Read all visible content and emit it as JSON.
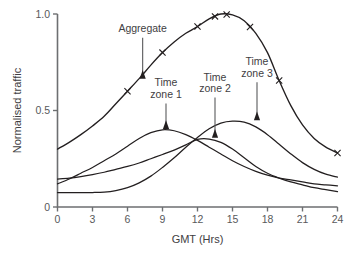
{
  "chart_data": {
    "type": "line",
    "title": "",
    "xlabel": "GMT (Hrs)",
    "ylabel": "Normalised traffic",
    "xlim": [
      0,
      24
    ],
    "ylim": [
      0,
      1.0
    ],
    "grid": false,
    "legend_position": "none",
    "xticks": [
      "0",
      "3",
      "6",
      "9",
      "12",
      "15",
      "18",
      "21",
      "24"
    ],
    "xtick_values": [
      0,
      3,
      6,
      9,
      12,
      15,
      18,
      21,
      24
    ],
    "yticks": [
      "0",
      "0.5",
      "1.0"
    ],
    "ytick_values": [
      0,
      0.5,
      1.0
    ],
    "x": [
      0,
      1,
      2,
      3,
      4,
      5,
      6,
      7,
      8,
      9,
      10,
      11,
      12,
      13,
      14,
      15,
      16,
      17,
      18,
      19,
      20,
      21,
      22,
      23,
      24
    ],
    "series": [
      {
        "name": "Aggregate",
        "marker": "x",
        "values": [
          0.3,
          0.335,
          0.375,
          0.42,
          0.47,
          0.535,
          0.6,
          0.665,
          0.735,
          0.8,
          0.855,
          0.9,
          0.935,
          0.975,
          1.0,
          0.995,
          0.965,
          0.9,
          0.8,
          0.655,
          0.525,
          0.425,
          0.355,
          0.31,
          0.28
        ]
      },
      {
        "name": "Time zone 1",
        "marker": "none",
        "values": [
          0.12,
          0.145,
          0.175,
          0.205,
          0.24,
          0.275,
          0.315,
          0.355,
          0.385,
          0.4,
          0.395,
          0.375,
          0.345,
          0.31,
          0.275,
          0.24,
          0.21,
          0.185,
          0.165,
          0.15,
          0.14,
          0.13,
          0.12,
          0.115,
          0.11
        ]
      },
      {
        "name": "Time zone 2",
        "marker": "none",
        "values": [
          0.145,
          0.15,
          0.158,
          0.168,
          0.18,
          0.195,
          0.21,
          0.228,
          0.25,
          0.272,
          0.295,
          0.322,
          0.35,
          0.352,
          0.335,
          0.3,
          0.255,
          0.21,
          0.175,
          0.15,
          0.13,
          0.115,
          0.1,
          0.09,
          0.08
        ]
      },
      {
        "name": "Time zone 3",
        "marker": "none",
        "values": [
          0.075,
          0.075,
          0.075,
          0.075,
          0.077,
          0.085,
          0.1,
          0.125,
          0.16,
          0.205,
          0.255,
          0.31,
          0.36,
          0.405,
          0.435,
          0.445,
          0.44,
          0.415,
          0.375,
          0.325,
          0.275,
          0.23,
          0.195,
          0.17,
          0.155
        ]
      }
    ],
    "annotations": [
      {
        "label": "Aggregate",
        "label_line1": "Aggregate",
        "label_line2": "",
        "x": 7.3,
        "target_y": 0.66,
        "label_y": 0.905
      },
      {
        "label": "Time zone 1",
        "label_line1": "Time",
        "label_line2": "zone 1",
        "x": 9.3,
        "target_y": 0.4,
        "label_y": 0.625
      },
      {
        "label": "Time zone 2",
        "label_line1": "Time",
        "label_line2": "zone 2",
        "x": 13.5,
        "target_y": 0.355,
        "label_y": 0.655
      },
      {
        "label": "Time zone 3",
        "label_line1": "Time",
        "label_line2": "zone 3",
        "x": 17.1,
        "target_y": 0.445,
        "label_y": 0.735
      }
    ]
  }
}
